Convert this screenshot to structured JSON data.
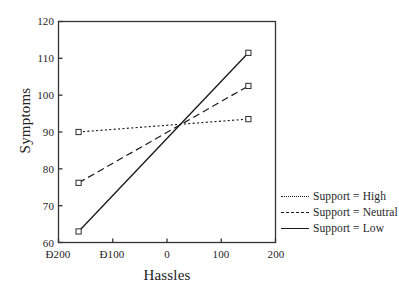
{
  "chart_data": {
    "type": "line",
    "title": "",
    "xlabel": "Hassles",
    "ylabel": "Symptoms",
    "xlim": [
      -200,
      200
    ],
    "ylim": [
      60,
      120
    ],
    "xticks": [
      -200,
      -100,
      0,
      100,
      200
    ],
    "xtick_labels": [
      "Ð200",
      "Ð100",
      "0",
      "100",
      "200"
    ],
    "yticks": [
      60,
      70,
      80,
      90,
      100,
      110,
      120
    ],
    "ytick_labels": [
      "60",
      "70",
      "80",
      "90",
      "100",
      "110",
      "120"
    ],
    "grid": false,
    "legend_position": "right",
    "marker": "open-square",
    "x": [
      -163,
      150
    ],
    "series": [
      {
        "name": "Support = High",
        "linestyle": "dotted",
        "values": [
          90.0,
          93.5
        ]
      },
      {
        "name": "Support = Neutral",
        "linestyle": "dashed",
        "values": [
          76.2,
          102.5
        ]
      },
      {
        "name": "Support = Low",
        "linestyle": "solid",
        "values": [
          63.0,
          111.5
        ]
      }
    ]
  },
  "legend": {
    "items": [
      {
        "label": "Support = High",
        "key": "dotted-line-icon"
      },
      {
        "label": "Support = Neutral",
        "key": "dashed-line-icon"
      },
      {
        "label": "Support = Low",
        "key": "solid-line-icon"
      }
    ]
  },
  "colors": {
    "ink": "#1a1a1a",
    "axis": "#333333",
    "background": "#ffffff"
  }
}
